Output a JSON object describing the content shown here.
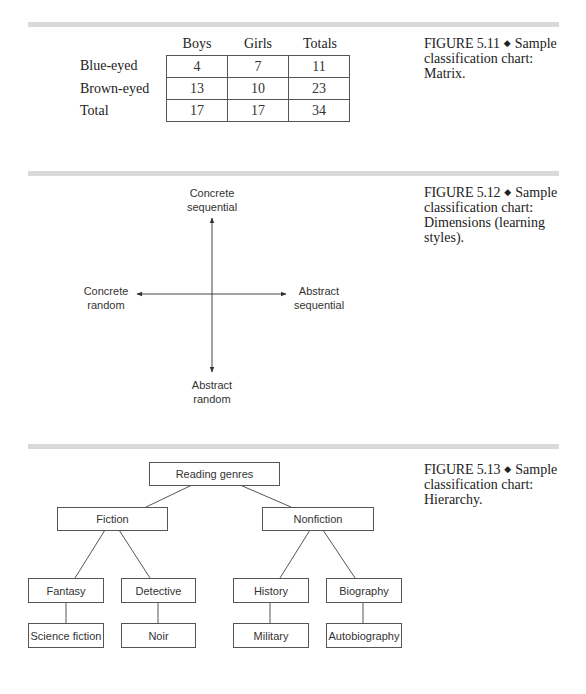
{
  "figures": [
    {
      "id": "5.11",
      "caption": {
        "number": "FIGURE 5.11",
        "title_line1": "Sample",
        "title_line2": "classification chart:",
        "title_line3": "Matrix."
      },
      "matrix": {
        "column_headers": [
          "Boys",
          "Girls",
          "Totals"
        ],
        "rows": [
          {
            "label": "Blue-eyed",
            "values": [
              "4",
              "7",
              "11"
            ]
          },
          {
            "label": "Brown-eyed",
            "values": [
              "13",
              "10",
              "23"
            ]
          },
          {
            "label": "Total",
            "values": [
              "17",
              "17",
              "34"
            ]
          }
        ]
      }
    },
    {
      "id": "5.12",
      "caption": {
        "number": "FIGURE 5.12",
        "title_line1": "Sample",
        "title_line2": "classification chart:",
        "title_line3": "Dimensions (learning",
        "title_line4": "styles)."
      },
      "axes": {
        "top": {
          "line1": "Concrete",
          "line2": "sequential"
        },
        "bottom": {
          "line1": "Abstract",
          "line2": "random"
        },
        "left": {
          "line1": "Concrete",
          "line2": "random"
        },
        "right": {
          "line1": "Abstract",
          "line2": "sequential"
        }
      }
    },
    {
      "id": "5.13",
      "caption": {
        "number": "FIGURE 5.13",
        "title_line1": "Sample",
        "title_line2": "classification chart:",
        "title_line3": "Hierarchy."
      },
      "hierarchy": {
        "root": "Reading genres",
        "level1": [
          "Fiction",
          "Nonfiction"
        ],
        "level2": [
          "Fantasy",
          "Detective",
          "History",
          "Biography"
        ],
        "level3": [
          "Science fiction",
          "Noir",
          "Military",
          "Autobiography"
        ]
      }
    }
  ],
  "bullet": "◆"
}
